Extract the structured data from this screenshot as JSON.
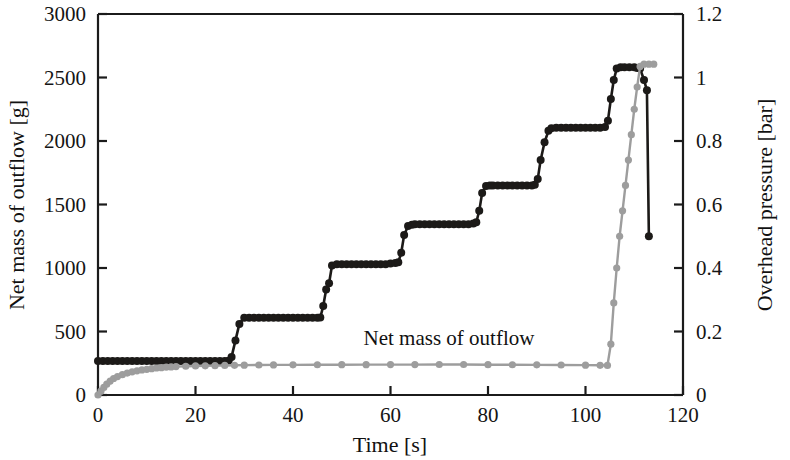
{
  "chart_data": {
    "type": "line",
    "title": "",
    "subtitle": "",
    "xlabel": "Time [s]",
    "ylabel": "Net mass of outflow [g]",
    "y2label": "Overhead pressure [bar]",
    "xlim": [
      0,
      120
    ],
    "ylim": [
      0,
      3000
    ],
    "y2lim": [
      0,
      1.2
    ],
    "xticks": [
      0,
      20,
      40,
      60,
      80,
      100,
      120
    ],
    "xticklabels": [
      "0",
      "20",
      "40",
      "60",
      "80",
      "100",
      "120"
    ],
    "yticks": [
      0,
      500,
      1000,
      1500,
      2000,
      2500,
      3000
    ],
    "yticklabels": [
      "0",
      "500",
      "1000",
      "1500",
      "2000",
      "2500",
      "3000"
    ],
    "y2ticks": [
      0,
      0.2,
      0.4,
      0.6,
      0.8,
      1.0,
      1.2
    ],
    "y2ticklabels": [
      "0",
      "0.2",
      "0.4",
      "0.6",
      "0.8",
      "1",
      "1.2"
    ],
    "grid": false,
    "legend_position": "none",
    "annotations": [
      {
        "text": "Net mass of outflow",
        "x": 72.0,
        "y": 390,
        "axis": "left",
        "color": "#111111"
      }
    ],
    "series": [
      {
        "name": "Net mass of outflow",
        "axis": "left",
        "color": "#1c1a18",
        "marker": "circle",
        "marker_size": 4.0,
        "line_width": 2.6,
        "x": [
          0.0,
          1.0,
          2.0,
          3.0,
          4.0,
          5.0,
          6.0,
          7.0,
          8.0,
          9.0,
          10.0,
          11.0,
          12.0,
          13.0,
          14.0,
          15.0,
          16.0,
          17.0,
          18.0,
          19.0,
          20.0,
          21.0,
          22.0,
          23.0,
          24.0,
          25.0,
          26.0,
          26.8,
          27.4,
          28.2,
          29.0,
          30.0,
          31.0,
          32.0,
          33.0,
          34.0,
          35.0,
          36.0,
          37.0,
          38.0,
          39.0,
          40.0,
          41.0,
          42.0,
          43.0,
          44.0,
          45.0,
          45.6,
          46.2,
          46.8,
          47.4,
          48.0,
          49.0,
          50.0,
          51.0,
          52.0,
          53.0,
          54.0,
          55.0,
          56.0,
          57.0,
          58.0,
          59.0,
          60.0,
          61.0,
          61.6,
          62.2,
          62.8,
          63.6,
          64.4,
          65.0,
          66.0,
          67.0,
          68.0,
          69.0,
          70.0,
          71.0,
          72.0,
          73.0,
          74.0,
          75.0,
          76.0,
          77.0,
          77.6,
          78.2,
          78.8,
          79.6,
          80.4,
          81.0,
          82.0,
          83.0,
          84.0,
          85.0,
          86.0,
          87.0,
          88.0,
          89.0,
          89.6,
          90.2,
          90.8,
          91.6,
          92.4,
          93.0,
          94.0,
          95.0,
          96.0,
          97.0,
          98.0,
          99.0,
          100.0,
          101.0,
          102.0,
          103.0,
          104.0,
          104.6,
          105.2,
          105.8,
          106.4,
          107.2,
          108.0,
          109.0,
          110.0,
          110.6,
          111.2,
          112.0,
          112.6,
          113.0
        ],
        "y": [
          268,
          268,
          268,
          268,
          268,
          268,
          268,
          268,
          268,
          268,
          268,
          268,
          268,
          268,
          268,
          268,
          268,
          268,
          268,
          268,
          268,
          268,
          268,
          268,
          268,
          268,
          268,
          270,
          300,
          430,
          560,
          608,
          608,
          608,
          608,
          608,
          608,
          608,
          608,
          608,
          608,
          608,
          608,
          608,
          608,
          608,
          608,
          610,
          700,
          830,
          880,
          1020,
          1030,
          1030,
          1030,
          1030,
          1030,
          1030,
          1030,
          1030,
          1030,
          1030,
          1030,
          1035,
          1040,
          1045,
          1120,
          1260,
          1330,
          1340,
          1345,
          1345,
          1345,
          1345,
          1345,
          1345,
          1345,
          1345,
          1345,
          1345,
          1345,
          1345,
          1350,
          1360,
          1450,
          1590,
          1645,
          1650,
          1650,
          1650,
          1650,
          1650,
          1650,
          1650,
          1650,
          1650,
          1650,
          1655,
          1700,
          1850,
          1990,
          2080,
          2100,
          2105,
          2105,
          2105,
          2105,
          2105,
          2105,
          2105,
          2105,
          2105,
          2105,
          2110,
          2160,
          2330,
          2480,
          2570,
          2580,
          2580,
          2580,
          2580,
          2575,
          2570,
          2480,
          2400,
          1250
        ]
      },
      {
        "name": "Overhead pressure",
        "axis": "right",
        "color": "#9d9d9d",
        "marker": "circle",
        "marker_size": 3.6,
        "line_width": 2.4,
        "x": [
          0.0,
          0.6,
          1.2,
          1.8,
          2.5,
          3.2,
          4.0,
          5.0,
          6.0,
          7.0,
          8.0,
          9.0,
          10.0,
          11.0,
          12.0,
          13.0,
          14.0,
          15.0,
          16.0,
          18.0,
          20.0,
          22.0,
          24.0,
          26.0,
          28.0,
          30.0,
          33.0,
          36.0,
          40.0,
          45.0,
          50.0,
          55.0,
          60.0,
          65.0,
          70.0,
          75.0,
          80.0,
          85.0,
          90.0,
          95.0,
          100.0,
          103.0,
          104.5,
          105.2,
          105.8,
          106.4,
          107.0,
          107.6,
          108.2,
          108.8,
          109.4,
          110.0,
          110.6,
          111.2,
          112.0,
          113.0,
          114.0
        ],
        "y": [
          0.0,
          0.012,
          0.024,
          0.034,
          0.044,
          0.052,
          0.058,
          0.064,
          0.069,
          0.073,
          0.076,
          0.079,
          0.081,
          0.083,
          0.085,
          0.086,
          0.0875,
          0.0885,
          0.0895,
          0.0905,
          0.0915,
          0.092,
          0.0925,
          0.093,
          0.0935,
          0.094,
          0.0945,
          0.0948,
          0.095,
          0.0952,
          0.0954,
          0.0956,
          0.0958,
          0.0958,
          0.096,
          0.096,
          0.0955,
          0.0952,
          0.095,
          0.0945,
          0.094,
          0.0935,
          0.093,
          0.16,
          0.29,
          0.4,
          0.5,
          0.58,
          0.66,
          0.74,
          0.82,
          0.9,
          0.97,
          1.035,
          1.042,
          1.042,
          1.042
        ]
      }
    ]
  },
  "axes": {
    "x_title": "Time [s]",
    "y_left_title": "Net mass of outflow [g]",
    "y_right_title": "Overhead pressure [bar]"
  },
  "colors": {
    "mass_series": "#1c1a18",
    "pressure_series": "#9d9d9d",
    "axis": "#1b1b1b",
    "background": "#ffffff"
  }
}
